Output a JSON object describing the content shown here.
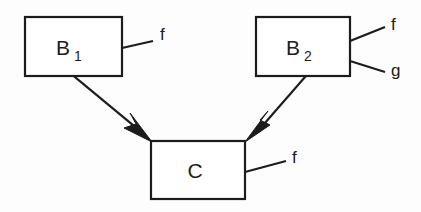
{
  "diagram": {
    "type": "class-inheritance-diagram",
    "background_color": "#fdfdfd",
    "line_color": "#1c1c1c",
    "nodes": [
      {
        "id": "b1",
        "name": "B",
        "subscript": "1",
        "x": 25,
        "y": 17,
        "width": 97,
        "height": 59,
        "methods": [
          "f"
        ]
      },
      {
        "id": "b2",
        "name": "B",
        "subscript": "2",
        "x": 256,
        "y": 17,
        "width": 94,
        "height": 59,
        "methods": [
          "f",
          "g"
        ]
      },
      {
        "id": "c",
        "name": "C",
        "subscript": "",
        "x": 151,
        "y": 141,
        "width": 94,
        "height": 58,
        "methods": [
          "f"
        ]
      }
    ],
    "labels": {
      "b1_name": "B",
      "b1_sub": "1",
      "b2_name": "B",
      "b2_sub": "2",
      "c_name": "C",
      "b1_method_f": "f",
      "b2_method_f": "f",
      "b2_method_g": "g",
      "c_method_f": "f"
    },
    "edges": [
      {
        "id": "b1-to-c",
        "from": "b1",
        "to": "c",
        "arrowhead": "filled-triangle",
        "direction": "down-right"
      },
      {
        "id": "b2-to-c",
        "from": "b2",
        "to": "c",
        "arrowhead": "filled-triangle",
        "direction": "down-left"
      }
    ]
  }
}
